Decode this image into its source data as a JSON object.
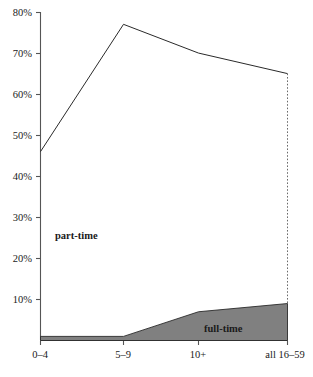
{
  "chart_data": {
    "type": "area",
    "title": "",
    "xlabel": "",
    "ylabel": "",
    "categories": [
      "0–4",
      "5–9",
      "10+",
      "all 16–59"
    ],
    "ylim": [
      0,
      80
    ],
    "yticks": [
      0,
      10,
      20,
      30,
      40,
      50,
      60,
      70,
      80
    ],
    "ytick_labels": [
      "",
      "10%",
      "20%",
      "30%",
      "40%",
      "50%",
      "60%",
      "70%",
      "80%"
    ],
    "grid": false,
    "legend_position": "inline-annotation",
    "series": [
      {
        "name": "part-time",
        "render": "line",
        "values": [
          46,
          77,
          70,
          65
        ],
        "color": "#2a2a2a",
        "fill": "none"
      },
      {
        "name": "full-time",
        "render": "area",
        "values": [
          1,
          1,
          7,
          9
        ],
        "color": "#2a2a2a",
        "fill": "#808080"
      }
    ],
    "annotations": [
      {
        "text": "part-time",
        "x_category": "0–4",
        "y_value": 26,
        "style": "bold"
      },
      {
        "text": "full-time",
        "x_category": "10+",
        "y_value": 3,
        "style": "bold"
      }
    ]
  },
  "axis": {
    "y_labels": [
      "80%",
      "70%",
      "60%",
      "50%",
      "40%",
      "30%",
      "20%",
      "10%"
    ],
    "x_labels": [
      "0–4",
      "5–9",
      "10+",
      "all 16–59"
    ]
  },
  "labels": {
    "part_time": "part-time",
    "full_time": "full-time"
  },
  "colors": {
    "full_time_fill": "#808080",
    "line": "#2a2a2a",
    "axis": "#555555",
    "background": "#ffffff"
  }
}
